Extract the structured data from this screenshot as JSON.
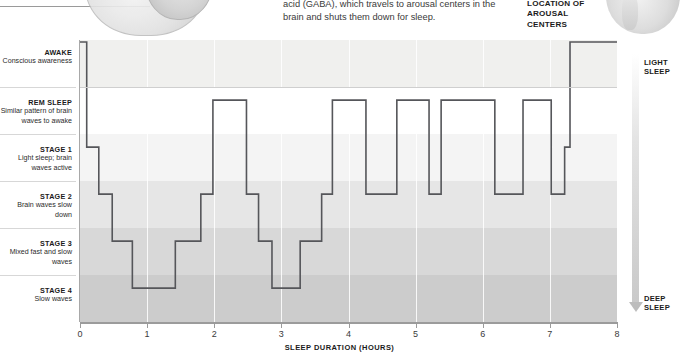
{
  "caption": {
    "gaba_text": "acid (GABA), which travels to arousal centers in the brain and shuts them down for sleep.",
    "arousal_label": "LOCATION OF AROUSAL CENTERS"
  },
  "axis": {
    "x_title": "SLEEP DURATION (HOURS)",
    "x_ticks": [
      "0",
      "1",
      "2",
      "3",
      "4",
      "5",
      "6",
      "7",
      "8"
    ],
    "light_sleep_label": "LIGHT SLEEP",
    "deep_sleep_label": "DEEP SLEEP"
  },
  "stages": [
    {
      "title": "AWAKE",
      "desc": "Conscious awareness"
    },
    {
      "title": "REM SLEEP",
      "desc": "Similar pattern of brain waves to awake"
    },
    {
      "title": "STAGE 1",
      "desc": "Light sleep; brain waves active"
    },
    {
      "title": "STAGE 2",
      "desc": "Brain waves slow down"
    },
    {
      "title": "STAGE 3",
      "desc": "Mixed fast and slow waves"
    },
    {
      "title": "STAGE 4",
      "desc": "Slow waves"
    }
  ],
  "colors": {
    "line": "#55565a",
    "axis": "#9b9b9b",
    "band_awake": "#f0f0ee",
    "band_rem": "#ffffff",
    "band_stage1": "#f4f4f4",
    "band_stage2": "#e6e6e6",
    "band_stage3": "#d8d8d8",
    "band_stage4": "#cccccc"
  },
  "chart_data": {
    "type": "line",
    "xlabel": "SLEEP DURATION (HOURS)",
    "ylabel": "Sleep stage",
    "xlim": [
      0,
      8
    ],
    "grid": true,
    "legend": "none",
    "step_interpolation": "post",
    "y_categories": [
      "AWAKE",
      "REM SLEEP",
      "STAGE 1",
      "STAGE 2",
      "STAGE 3",
      "STAGE 4"
    ],
    "y_levels": {
      "AWAKE": 0,
      "REM SLEEP": 1,
      "STAGE 1": 2,
      "STAGE 2": 3,
      "STAGE 3": 4,
      "STAGE 4": 5
    },
    "series": [
      {
        "name": "Sleep stage over time",
        "points": [
          {
            "x": 0.0,
            "stage": "AWAKE"
          },
          {
            "x": 0.1,
            "stage": "AWAKE"
          },
          {
            "x": 0.1,
            "stage": "STAGE 1"
          },
          {
            "x": 0.28,
            "stage": "STAGE 1"
          },
          {
            "x": 0.28,
            "stage": "STAGE 2"
          },
          {
            "x": 0.48,
            "stage": "STAGE 2"
          },
          {
            "x": 0.48,
            "stage": "STAGE 3"
          },
          {
            "x": 0.78,
            "stage": "STAGE 3"
          },
          {
            "x": 0.78,
            "stage": "STAGE 4"
          },
          {
            "x": 1.42,
            "stage": "STAGE 4"
          },
          {
            "x": 1.42,
            "stage": "STAGE 3"
          },
          {
            "x": 1.8,
            "stage": "STAGE 3"
          },
          {
            "x": 1.8,
            "stage": "STAGE 2"
          },
          {
            "x": 1.98,
            "stage": "STAGE 2"
          },
          {
            "x": 1.98,
            "stage": "REM SLEEP"
          },
          {
            "x": 2.48,
            "stage": "REM SLEEP"
          },
          {
            "x": 2.48,
            "stage": "STAGE 2"
          },
          {
            "x": 2.66,
            "stage": "STAGE 2"
          },
          {
            "x": 2.66,
            "stage": "STAGE 3"
          },
          {
            "x": 2.86,
            "stage": "STAGE 3"
          },
          {
            "x": 2.86,
            "stage": "STAGE 4"
          },
          {
            "x": 3.28,
            "stage": "STAGE 4"
          },
          {
            "x": 3.28,
            "stage": "STAGE 3"
          },
          {
            "x": 3.6,
            "stage": "STAGE 3"
          },
          {
            "x": 3.6,
            "stage": "STAGE 2"
          },
          {
            "x": 3.76,
            "stage": "STAGE 2"
          },
          {
            "x": 3.76,
            "stage": "REM SLEEP"
          },
          {
            "x": 4.26,
            "stage": "REM SLEEP"
          },
          {
            "x": 4.26,
            "stage": "STAGE 2"
          },
          {
            "x": 4.72,
            "stage": "STAGE 2"
          },
          {
            "x": 4.72,
            "stage": "REM SLEEP"
          },
          {
            "x": 5.2,
            "stage": "REM SLEEP"
          },
          {
            "x": 5.2,
            "stage": "STAGE 2"
          },
          {
            "x": 5.38,
            "stage": "STAGE 2"
          },
          {
            "x": 5.38,
            "stage": "REM SLEEP"
          },
          {
            "x": 6.18,
            "stage": "REM SLEEP"
          },
          {
            "x": 6.18,
            "stage": "STAGE 2"
          },
          {
            "x": 6.6,
            "stage": "STAGE 2"
          },
          {
            "x": 6.6,
            "stage": "REM SLEEP"
          },
          {
            "x": 7.02,
            "stage": "REM SLEEP"
          },
          {
            "x": 7.02,
            "stage": "STAGE 2"
          },
          {
            "x": 7.22,
            "stage": "STAGE 2"
          },
          {
            "x": 7.22,
            "stage": "STAGE 1"
          },
          {
            "x": 7.3,
            "stage": "STAGE 1"
          },
          {
            "x": 7.3,
            "stage": "AWAKE"
          },
          {
            "x": 8.0,
            "stage": "AWAKE"
          }
        ]
      }
    ]
  }
}
